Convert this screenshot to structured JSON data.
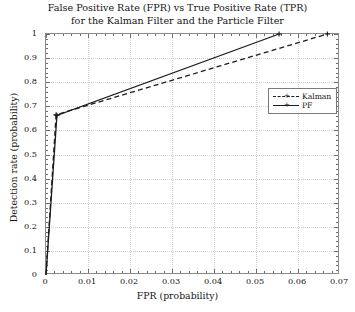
{
  "chart_data": {
    "type": "line",
    "title": "False Positive Rate (FPR) vs True Positive Rate (TPR) for the Kalman Filter and the Particle Filter",
    "title_line1": "False Positive Rate (FPR) vs True Positive Rate (TPR)",
    "title_line2": "for the Kalman Filter and the Particle Filter",
    "xlabel": "FPR (probability)",
    "ylabel": "Detection rate (probability)",
    "xlim": [
      0,
      0.07
    ],
    "ylim": [
      0,
      1
    ],
    "xticks": [
      "0",
      "0.01",
      "0.02",
      "0.03",
      "0.04",
      "0.05",
      "0.06",
      "0.07"
    ],
    "xtick_values": [
      0,
      0.01,
      0.02,
      0.03,
      0.04,
      0.05,
      0.06,
      0.07
    ],
    "yticks": [
      "0",
      "0.1",
      "0.2",
      "0.3",
      "0.4",
      "0.5",
      "0.6",
      "0.7",
      "0.8",
      "0.9",
      "1"
    ],
    "ytick_values": [
      0,
      0.1,
      0.2,
      0.3,
      0.4,
      0.5,
      0.6,
      0.7,
      0.8,
      0.9,
      1
    ],
    "grid": true,
    "legend_position": "upper right",
    "series": [
      {
        "name": "Kalman",
        "style": "dashed",
        "marker": "plus",
        "color": "#1c1c1c",
        "x": [
          0,
          0.0024,
          0.067
        ],
        "y": [
          0,
          0.665,
          1.0
        ]
      },
      {
        "name": "PF",
        "style": "solid",
        "marker": "plus",
        "color": "#1c1c1c",
        "x": [
          0,
          0.0026,
          0.0555
        ],
        "y": [
          0,
          0.662,
          1.0
        ]
      }
    ]
  },
  "legend": {
    "items": [
      {
        "label": "Kalman"
      },
      {
        "label": "PF"
      }
    ]
  }
}
